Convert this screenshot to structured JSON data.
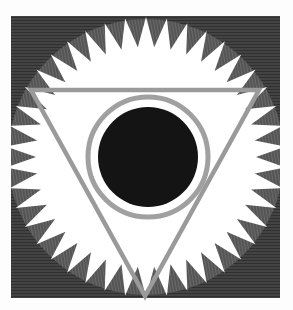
{
  "artwork": {
    "description": "Engraved symbol: sun disc with inward-pointing rays inside a hatched square, inverted triangle, ringed black circle",
    "canvas": {
      "width": 293,
      "height": 310,
      "background": "#fdfdfd"
    },
    "frame": {
      "x": 11,
      "y": 16,
      "width": 269,
      "height": 282,
      "fill": "#2b2b2b",
      "hatch_color": "#6a6a6a"
    },
    "disc": {
      "cx": 146,
      "cy": 157,
      "r": 138,
      "fill": "#ffffff"
    },
    "rays": {
      "count": 42,
      "depth": 28,
      "fill": "#5a5a5a",
      "hatch_color": "#2e2e2e"
    },
    "triangle": {
      "points": [
        [
          31,
          90
        ],
        [
          259,
          90
        ],
        [
          145,
          296
        ]
      ],
      "stroke": "#9a9a9a",
      "stroke_width": 4.5
    },
    "ring": {
      "cx": 148,
      "cy": 157,
      "r": 60,
      "stroke": "#a0a0a0",
      "stroke_width": 5
    },
    "core": {
      "cx": 148,
      "cy": 157,
      "r": 50,
      "fill": "#141414"
    }
  }
}
